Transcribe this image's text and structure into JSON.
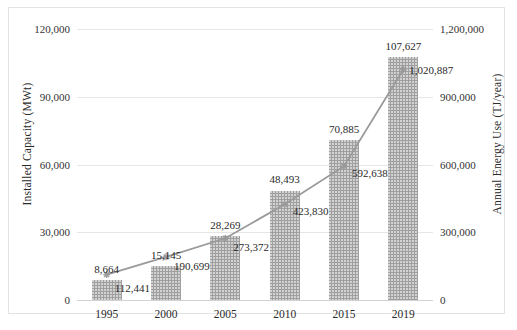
{
  "chart_data": {
    "type": "bar",
    "title": "",
    "subtitle": "",
    "xlabel": "",
    "ylabel": "Installed Capacity (MWt)",
    "y2label": "Annual Energy Use (TJ/year)",
    "categories": [
      "1995",
      "2000",
      "2005",
      "2010",
      "2015",
      "2019"
    ],
    "grid": true,
    "legend": "none",
    "ylim": [
      0,
      120000
    ],
    "y2lim": [
      0,
      1200000
    ],
    "yticks": [
      "0",
      "30,000",
      "60,000",
      "90,000",
      "120,000"
    ],
    "ytick_values": [
      0,
      30000,
      60000,
      90000,
      120000
    ],
    "y2ticks": [
      "0",
      "300,000",
      "600,000",
      "900,000",
      "1,200,000"
    ],
    "y2tick_values": [
      0,
      300000,
      600000,
      900000,
      1200000
    ],
    "series": [
      {
        "name": "Installed Capacity (MWt)",
        "type": "bar",
        "axis": "left",
        "color": "#9f9f9f",
        "values": [
          8664,
          15145,
          28269,
          48493,
          70885,
          107627
        ],
        "labels": [
          "8,664",
          "15,145",
          "28,269",
          "48,493",
          "70,885",
          "107,627"
        ]
      },
      {
        "name": "Annual Energy Use (TJ/year)",
        "type": "line",
        "axis": "right",
        "color": "#9a9a9a",
        "values": [
          112441,
          190699,
          273372,
          423830,
          592638,
          1020887
        ],
        "labels": [
          "112,441",
          "190,699",
          "273,372",
          "423,830",
          "592,638",
          "1,020,887"
        ]
      }
    ]
  }
}
